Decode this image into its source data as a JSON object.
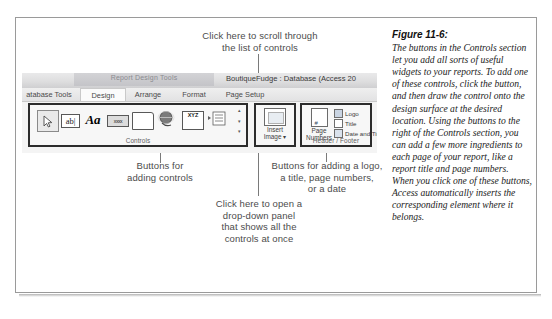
{
  "figure": {
    "title": "Figure 11-6:",
    "body": "The buttons in the Controls section let you add all sorts of useful widgets to your reports. To add one of these controls, click the button, and then draw the control onto the design surface at the desired location. Using the buttons to the right of the Controls section, you can add a few more ingredients to each page of your report, like a report title and page numbers. When you click one of these buttons, Access automatically inserts the corresponding element where it belongs."
  },
  "callouts": {
    "scroll": "Click here to scroll through\nthe list of controls",
    "controls": "Buttons for\nadding controls",
    "header_footer": "Buttons for adding a logo,\na title, page numbers,\nor a date",
    "dropdown": "Click here to open a\ndrop-down panel\nthat shows all the\ncontrols at once"
  },
  "screenshot": {
    "contextual_tab_title": "Report Design Tools",
    "window_title": "BoutiqueFudge : Database (Access 20",
    "tabs": [
      {
        "label": "atabase Tools",
        "active": false
      },
      {
        "label": "Design",
        "active": true
      },
      {
        "label": "Arrange",
        "active": false
      },
      {
        "label": "Format",
        "active": false
      },
      {
        "label": "Page Setup",
        "active": false
      }
    ],
    "groups": {
      "controls": {
        "label": "Controls",
        "items": [
          {
            "name": "select-tool",
            "glyph": "arrow"
          },
          {
            "name": "text-box",
            "glyph": "ab|"
          },
          {
            "name": "label",
            "glyph": "Aa"
          },
          {
            "name": "button",
            "glyph": "xxxx"
          },
          {
            "name": "tab-control",
            "glyph": "folder"
          },
          {
            "name": "hyperlink",
            "glyph": "globe"
          },
          {
            "name": "unbound-object-frame",
            "glyph": "XYZ"
          },
          {
            "name": "list-box",
            "glyph": "list"
          }
        ],
        "scroll_up": "▴",
        "scroll_down": "▾",
        "scroll_more": "▾"
      },
      "insert_image": {
        "label_line1": "Insert",
        "label_line2": "Image ▾"
      },
      "header_footer": {
        "label": "Header / Footer",
        "page_numbers_line1": "Page",
        "page_numbers_line2": "Numbers",
        "items": [
          {
            "label": "Logo"
          },
          {
            "label": "Title"
          },
          {
            "label": "Date and Time"
          }
        ]
      }
    }
  },
  "colors": {
    "frame_border": "#9a9a9a",
    "callout_text": "#4c4c4c",
    "caption_text": "#232323",
    "highlight_box": "#2c2c2c"
  }
}
